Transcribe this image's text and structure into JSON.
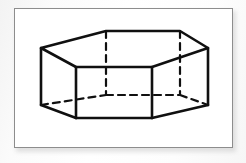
{
  "document": {
    "title": "Hexagonal Prism",
    "figure_caption": "",
    "background_color": "#fdfdfd",
    "frame_color": "#8d8d8d",
    "frame_fill": "#ffffff"
  },
  "figure": {
    "name": "hexagonal-prism",
    "shape_type": "hexagonal prism",
    "stroke_color": "#101010",
    "visible_stroke_width": 2.6,
    "hidden_stroke_width": 2.2,
    "hidden_dash_pattern": "7,5",
    "vertex_count": 12,
    "edge_count": 18,
    "face_count": 8,
    "visible_edge_count": 12,
    "hidden_edge_count": 6,
    "top_hexagon": {
      "label": "top face",
      "vertices": [
        {
          "id": "T1",
          "role": "left",
          "x": 41,
          "y": 48
        },
        {
          "id": "T2",
          "role": "front-left",
          "x": 76,
          "y": 67
        },
        {
          "id": "T3",
          "role": "front-right",
          "x": 152,
          "y": 67
        },
        {
          "id": "T4",
          "role": "right",
          "x": 208,
          "y": 48
        },
        {
          "id": "T5",
          "role": "back-right",
          "x": 180,
          "y": 31
        },
        {
          "id": "T6",
          "role": "back-left",
          "x": 106,
          "y": 31
        }
      ]
    },
    "bottom_hexagon": {
      "label": "bottom face",
      "vertices": [
        {
          "id": "B1",
          "role": "left",
          "x": 41,
          "y": 105
        },
        {
          "id": "B2",
          "role": "front-left",
          "x": 76,
          "y": 118
        },
        {
          "id": "B3",
          "role": "front-right",
          "x": 152,
          "y": 118
        },
        {
          "id": "B4",
          "role": "right",
          "x": 208,
          "y": 105
        },
        {
          "id": "B5",
          "role": "back-right",
          "x": 180,
          "y": 95
        },
        {
          "id": "B6",
          "role": "back-left",
          "x": 106,
          "y": 95
        }
      ]
    },
    "vertical_edges": [
      {
        "id": "E-left",
        "from": "T1",
        "to": "B1",
        "hidden": false
      },
      {
        "id": "E-front-left",
        "from": "T2",
        "to": "B2",
        "hidden": false
      },
      {
        "id": "E-front-right",
        "from": "T3",
        "to": "B3",
        "hidden": false
      },
      {
        "id": "E-right",
        "from": "T4",
        "to": "B4",
        "hidden": false
      },
      {
        "id": "E-back-right",
        "from": "T5",
        "to": "B5",
        "hidden": true
      },
      {
        "id": "E-back-left",
        "from": "T6",
        "to": "B6",
        "hidden": true
      }
    ],
    "hidden_bottom_edges": [
      {
        "id": "HB-left",
        "from": "B1",
        "to": "B6"
      },
      {
        "id": "HB-back",
        "from": "B6",
        "to": "B5"
      },
      {
        "id": "HB-right",
        "from": "B5",
        "to": "B4"
      }
    ]
  }
}
